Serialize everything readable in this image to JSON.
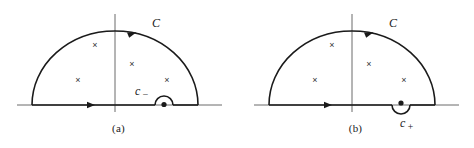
{
  "figure": {
    "type": "contour-integration-diagram",
    "background": "#ffffff",
    "ink": "#1a1a1a",
    "axis_color": "#6b6b6b",
    "panels": [
      {
        "id": "a",
        "caption": "(a)",
        "contour_label": "C",
        "contour_direction": "counterclockwise",
        "arc_arrow_direction": "left",
        "axis_arrow_direction": "right",
        "indent_label": "c",
        "indent_subscript": "−",
        "indent_label_full": "c−",
        "indent_orientation": "above-axis",
        "indent_label_position": "upper-left",
        "pole_marker": "×",
        "pole_count": 4,
        "poles": [
          {
            "x": 95,
            "y": 48
          },
          {
            "x": 132,
            "y": 67
          },
          {
            "x": 78,
            "y": 83
          },
          {
            "x": 167,
            "y": 83
          }
        ],
        "singular_point_on_axis": true,
        "geometry": {
          "baseline_y": 105,
          "axis_x_start": 17,
          "axis_x_end": 222,
          "arc_left_x": 32,
          "arc_right_x": 198,
          "arc_apex_y": 31,
          "vertical_axis_x": 115,
          "vertical_axis_top": 14,
          "vertical_axis_bottom": 112,
          "indent_center_x": 164,
          "indent_radius": 9
        }
      },
      {
        "id": "b",
        "caption": "(b)",
        "contour_label": "C",
        "contour_direction": "counterclockwise",
        "arc_arrow_direction": "left",
        "axis_arrow_direction": "right",
        "indent_label": "c",
        "indent_subscript": "+",
        "indent_label_full": "c+",
        "indent_orientation": "below-axis",
        "indent_label_position": "below",
        "pole_marker": "×",
        "pole_count": 4,
        "poles": [
          {
            "x": 95,
            "y": 48
          },
          {
            "x": 132,
            "y": 67
          },
          {
            "x": 78,
            "y": 83
          },
          {
            "x": 167,
            "y": 83
          }
        ],
        "singular_point_on_axis": true,
        "geometry": {
          "baseline_y": 105,
          "axis_x_start": 17,
          "axis_x_end": 222,
          "arc_left_x": 32,
          "arc_right_x": 198,
          "arc_apex_y": 31,
          "vertical_axis_x": 115,
          "vertical_axis_top": 14,
          "vertical_axis_bottom": 112,
          "indent_center_x": 164,
          "indent_radius": 9
        }
      }
    ]
  }
}
